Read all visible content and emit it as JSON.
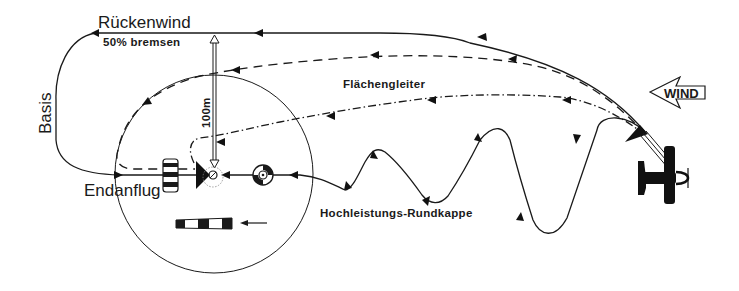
{
  "diagram": {
    "labels": {
      "downwind": "Rückenwind",
      "downwind_note": "50% bremsen",
      "base": "Basis",
      "final": "Endanflug",
      "flat_glider": "Flächengleiter",
      "height_marker": "100m",
      "high_performance_round": "Hochleistungs-Rundkappe",
      "wind": "WIND"
    },
    "legend": {
      "solid_line": "Rückenwind / Basis / Endanflug",
      "dashed_line": "Flächengleiter",
      "dash_dot_line": "Flächengleiter (alternative)",
      "wavy_line": "Hochleistungs-Rundkappe"
    },
    "colors": {
      "ink": "#1a1a1a",
      "background": "#ffffff"
    },
    "elements": {
      "landing_circle": {
        "cx": 214,
        "cy": 174,
        "r": 99
      },
      "target_center": {
        "x": 213,
        "y": 175
      },
      "aircraft_position": {
        "x": 660,
        "y": 175
      }
    }
  }
}
